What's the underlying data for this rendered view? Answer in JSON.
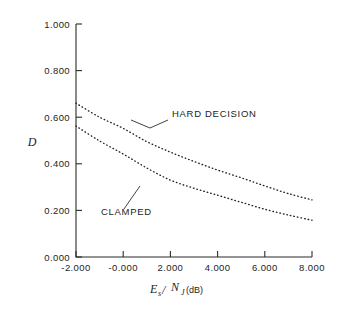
{
  "figure": {
    "background_color": "#ffffff",
    "ink_color": "#1d1d1d"
  },
  "chart_data": {
    "type": "line",
    "title": "",
    "subtitle": "",
    "xlabel": "Es/NJ (dB)",
    "xlabel_parts": {
      "base1": "E",
      "sub1": "s",
      "slash": "/",
      "base2": "N",
      "sub2": "J",
      "unit": "(dB)"
    },
    "ylabel": "D",
    "xlim": [
      -2.0,
      8.0
    ],
    "ylim": [
      0.0,
      1.0
    ],
    "xticks": [
      -2.0,
      0.0,
      2.0,
      4.0,
      6.0,
      8.0
    ],
    "yticks": [
      0.0,
      0.2,
      0.4,
      0.6,
      0.8,
      1.0
    ],
    "xticklabels": [
      "-2.000",
      "-0.000",
      "2.000",
      "4.000",
      "6.000",
      "8.000"
    ],
    "yticklabels": [
      "0.000",
      "0.200",
      "0.400",
      "0.600",
      "0.800",
      "1.000"
    ],
    "grid": false,
    "legend_position": "inline-annotations",
    "line_style": "dotted",
    "x": [
      -2.0,
      -1.0,
      0.0,
      1.0,
      2.0,
      3.0,
      4.0,
      5.0,
      6.0,
      7.0,
      8.0
    ],
    "series": [
      {
        "name": "HARD DECISION",
        "label": "HARD DECISION",
        "values": [
          0.66,
          0.6,
          0.552,
          0.495,
          0.45,
          0.41,
          0.373,
          0.34,
          0.305,
          0.272,
          0.245
        ]
      },
      {
        "name": "CLAMPED",
        "label": "CLAMPED",
        "values": [
          0.562,
          0.498,
          0.442,
          0.382,
          0.33,
          0.295,
          0.265,
          0.235,
          0.205,
          0.18,
          0.158
        ]
      }
    ],
    "annotations": [
      {
        "text": "HARD DECISION",
        "text_x_px": 172,
        "text_y_px": 117,
        "leader_from_px": [
          168,
          120
        ],
        "leader_via_px": [
          150,
          128
        ],
        "leader_to_px": [
          131,
          120
        ]
      },
      {
        "text": "CLAMPED",
        "text_x_px": 101,
        "text_y_px": 215,
        "leader_from_px": [
          124,
          209
        ],
        "leader_via_px": [
          133,
          196
        ],
        "leader_to_px": [
          140,
          186
        ]
      }
    ]
  }
}
